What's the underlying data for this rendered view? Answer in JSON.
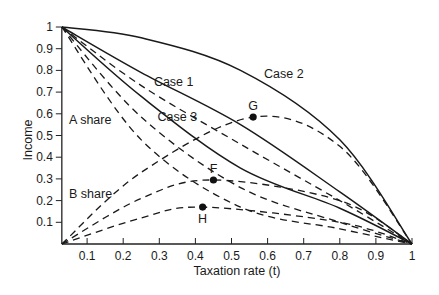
{
  "chart_data": {
    "type": "line",
    "title": "",
    "xlabel": "Taxation rate (t)",
    "ylabel": "Income",
    "xlim": [
      0,
      1
    ],
    "ylim": [
      0,
      1
    ],
    "grid": false,
    "legend": "none",
    "x_ticks": [
      "0.1",
      "0.2",
      "0.3",
      "0.4",
      "0.5",
      "0.6",
      "0.7",
      "0.8",
      "0.9",
      "1"
    ],
    "y_ticks": [
      "0.1",
      "0.2",
      "0.3",
      "0.4",
      "0.5",
      "0.6",
      "0.7",
      "0.8",
      "0.9",
      "1"
    ],
    "series": [
      {
        "name": "Case 2",
        "style": "solid",
        "x": [
          0.03,
          0.25,
          0.525,
          0.8,
          1.0
        ],
        "y": [
          1.0,
          0.95,
          0.8,
          0.48,
          0.0
        ]
      },
      {
        "name": "Case 1",
        "style": "solid",
        "x": [
          0.03,
          0.25,
          0.525,
          0.8,
          1.0
        ],
        "y": [
          1.0,
          0.79,
          0.55,
          0.24,
          0.0
        ]
      },
      {
        "name": "Case 3",
        "style": "solid",
        "x": [
          0.03,
          0.25,
          0.525,
          0.8,
          1.0
        ],
        "y": [
          1.0,
          0.68,
          0.35,
          0.165,
          0.0
        ]
      },
      {
        "name": "A share (Case 2)",
        "style": "dashed",
        "x": [
          0.03,
          0.25,
          0.525,
          0.8,
          1.0
        ],
        "y": [
          1.0,
          0.73,
          0.46,
          0.2,
          0.0
        ]
      },
      {
        "name": "A share (Case 1)",
        "style": "dashed",
        "x": [
          0.03,
          0.25,
          0.525,
          0.8,
          1.0
        ],
        "y": [
          1.0,
          0.585,
          0.26,
          0.1,
          0.0
        ]
      },
      {
        "name": "A share (Case 3)",
        "style": "dashed",
        "x": [
          0.03,
          0.25,
          0.525,
          0.8,
          1.0
        ],
        "y": [
          1.0,
          0.48,
          0.17,
          0.07,
          0.0
        ]
      },
      {
        "name": "B share (Case 2)",
        "style": "dashed",
        "x": [
          0.03,
          0.25,
          0.56,
          0.8,
          1.0
        ],
        "y": [
          0.0,
          0.33,
          0.585,
          0.45,
          0.0
        ]
      },
      {
        "name": "B share (Case 1)",
        "style": "dashed",
        "x": [
          0.03,
          0.25,
          0.45,
          0.8,
          1.0
        ],
        "y": [
          0.0,
          0.21,
          0.295,
          0.2,
          0.0
        ]
      },
      {
        "name": "B share (Case 3)",
        "style": "dashed",
        "x": [
          0.03,
          0.25,
          0.42,
          0.8,
          1.0
        ],
        "y": [
          0.0,
          0.12,
          0.17,
          0.1,
          0.0
        ]
      }
    ],
    "points": [
      {
        "label": "G",
        "x": 0.56,
        "y": 0.585
      },
      {
        "label": "F",
        "x": 0.45,
        "y": 0.295
      },
      {
        "label": "H",
        "x": 0.42,
        "y": 0.17
      }
    ],
    "annotations": [
      {
        "text": "Case 1",
        "x": 0.285,
        "y": 0.745
      },
      {
        "text": "Case 2",
        "x": 0.59,
        "y": 0.785
      },
      {
        "text": "Case 3",
        "x": 0.295,
        "y": 0.585
      },
      {
        "text": "A share",
        "x": 0.05,
        "y": 0.57
      },
      {
        "text": "B share",
        "x": 0.05,
        "y": 0.23
      }
    ]
  }
}
